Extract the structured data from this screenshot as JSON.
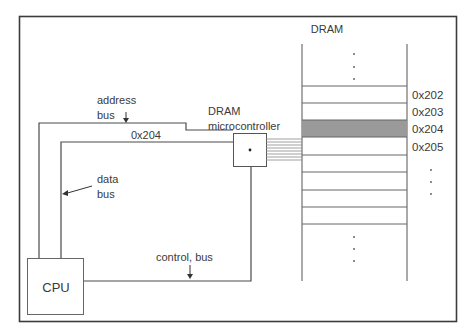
{
  "diagram": {
    "title": "DRAM",
    "colors": {
      "line": "#4a4a4a",
      "frame": "#3c3c3c",
      "highlight_row": "#9a9a9a",
      "text": "#3a3a3a"
    },
    "labels": {
      "address_bus": [
        "address",
        "bus"
      ],
      "address_value": "0x204",
      "data_bus": [
        "data",
        "bus"
      ],
      "control_bus": "control, bus",
      "controller": [
        "DRAM",
        "microcontroller"
      ],
      "cpu": "CPU",
      "dram": "DRAM"
    },
    "dram_rows": [
      {
        "address": "0x202",
        "highlighted": false
      },
      {
        "address": "0x203",
        "highlighted": false
      },
      {
        "address": "0x204",
        "highlighted": true
      },
      {
        "address": "0x205",
        "highlighted": false
      }
    ],
    "ellipsis": "⋮"
  }
}
